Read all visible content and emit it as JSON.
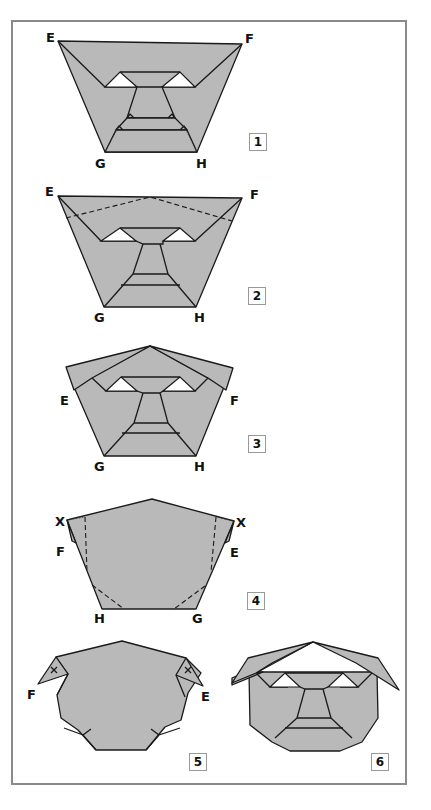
{
  "steps": [
    {
      "number": "1",
      "labels": {
        "E": "E",
        "F": "F",
        "G": "G",
        "H": "H"
      }
    },
    {
      "number": "2",
      "labels": {
        "E": "E",
        "F": "F",
        "G": "G",
        "H": "H"
      }
    },
    {
      "number": "3",
      "labels": {
        "E": "E",
        "F": "F",
        "G": "G",
        "H": "H"
      }
    },
    {
      "number": "4",
      "labels": {
        "X_left": "X",
        "X_right": "X",
        "F": "F",
        "E": "E",
        "H": "H",
        "G": "G"
      }
    },
    {
      "number": "5",
      "labels": {
        "F": "F",
        "E": "E"
      }
    },
    {
      "number": "6",
      "labels": {}
    }
  ],
  "colors": {
    "paper": "#b9b9b9",
    "outline": "#1a1a1a",
    "frame": "#8a8a8a",
    "background": "#ffffff"
  }
}
